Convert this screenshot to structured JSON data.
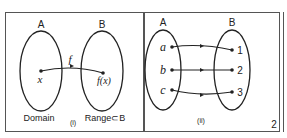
{
  "panel_left": {
    "set_a_label": "A",
    "set_b_label": "B",
    "mapping_label": "f",
    "element_x": "x",
    "element_fx": "f(x)",
    "domain_label": "Domain",
    "range_label": "Range⊂B",
    "caption": "(i)"
  },
  "panel_right": {
    "set_a_label": "A",
    "set_b_label": "B",
    "domain_elements": [
      "a",
      "b",
      "c"
    ],
    "codomain_elements": [
      "1",
      "2",
      "3"
    ],
    "mappings": [
      {
        "from": "a",
        "to": "1"
      },
      {
        "from": "b",
        "to": "2"
      },
      {
        "from": "c",
        "to": "3"
      }
    ],
    "caption": "(ii)"
  },
  "page_number": "2",
  "colors": {
    "stroke": "#222222",
    "border": "#555555"
  }
}
